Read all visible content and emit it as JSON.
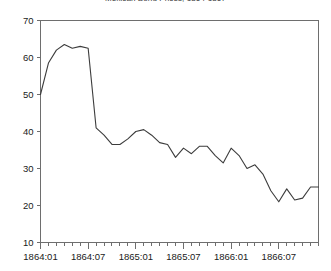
{
  "chart_data": {
    "type": "line",
    "title": "Mexican Bond Prices, 1864-1867",
    "xlabel": "",
    "ylabel": "",
    "ylim": [
      10,
      70
    ],
    "ytick_values": [
      10,
      20,
      30,
      40,
      50,
      60,
      70
    ],
    "ytick_labels": [
      "10",
      "20",
      "30",
      "40",
      "50",
      "60",
      "70"
    ],
    "xtick_labels": [
      "1864:01",
      "1864:07",
      "1865:01",
      "1865:07",
      "1866:01",
      "1866:07"
    ],
    "xtick_positions": [
      0,
      6,
      12,
      18,
      24,
      30
    ],
    "minor_ticks": "monthly",
    "grid": false,
    "legend": "none",
    "x": [
      "1864:01",
      "1864:02",
      "1864:03",
      "1864:04",
      "1864:05",
      "1864:06",
      "1864:07",
      "1864:08",
      "1864:09",
      "1864:10",
      "1864:11",
      "1864:12",
      "1865:01",
      "1865:02",
      "1865:03",
      "1865:04",
      "1865:05",
      "1865:06",
      "1865:07",
      "1865:08",
      "1865:09",
      "1865:10",
      "1865:11",
      "1865:12",
      "1866:01",
      "1866:02",
      "1866:03",
      "1866:04",
      "1866:05",
      "1866:06",
      "1866:07",
      "1866:08",
      "1866:09",
      "1866:10",
      "1866:11",
      "1866:12"
    ],
    "values": [
      50.0,
      58.5,
      62.0,
      63.5,
      62.5,
      63.0,
      62.5,
      41.0,
      39.0,
      36.5,
      36.5,
      38.0,
      40.0,
      40.5,
      39.0,
      37.0,
      36.5,
      33.0,
      35.5,
      34.0,
      36.0,
      36.0,
      33.5,
      31.5,
      35.5,
      33.5,
      30.0,
      31.0,
      28.5,
      24.0,
      21.0,
      24.5,
      21.5,
      22.0,
      25.0,
      25.0
    ],
    "series_name": "Mexican bond price",
    "line_color": "#3c3c3c",
    "axis_color": "#6e6e6e",
    "background": "#ffffff"
  }
}
